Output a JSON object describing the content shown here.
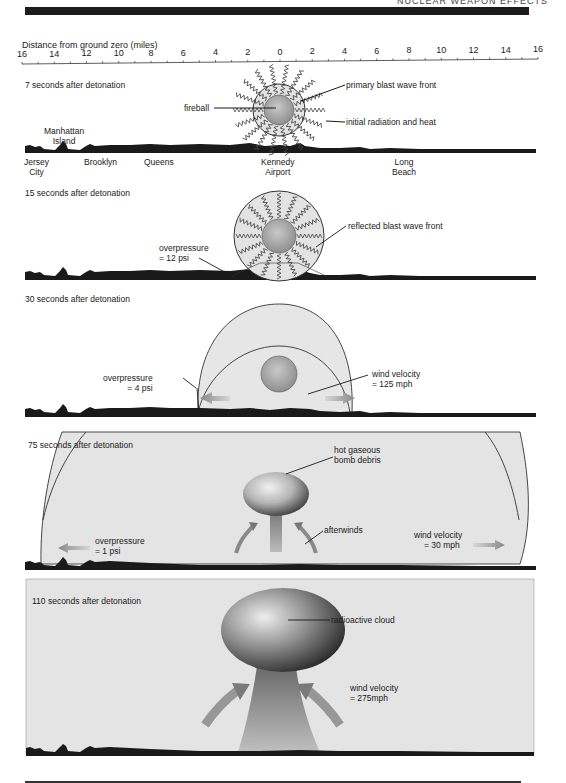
{
  "header": {
    "running_title": "NUCLEAR WEAPON EFFECTS"
  },
  "axis": {
    "title": "Distance from ground zero (miles)",
    "ticks": [
      "16",
      "14",
      "12",
      "10",
      "8",
      "6",
      "4",
      "2",
      "0",
      "2",
      "4",
      "6",
      "8",
      "10",
      "12",
      "14",
      "16"
    ]
  },
  "places": {
    "jersey_city_1": "Jersey",
    "jersey_city_2": "City",
    "manhattan_1": "Manhattan",
    "manhattan_2": "Island",
    "brooklyn": "Brooklyn",
    "queens": "Queens",
    "kennedy_1": "Kennedy",
    "kennedy_2": "Airport",
    "long_beach_1": "Long",
    "long_beach_2": "Beach"
  },
  "panels": [
    {
      "title": "7 seconds after detonation",
      "labels": {
        "fireball": "fireball",
        "primary": "primary blast wave front",
        "radiation": "initial radiation and heat"
      }
    },
    {
      "title": "15 seconds after detonation",
      "labels": {
        "overpressure_1": "overpressure",
        "overpressure_2": "= 12 psi",
        "reflected": "reflected blast wave front"
      }
    },
    {
      "title": "30 seconds after detonation",
      "labels": {
        "overpressure_1": "overpressure",
        "overpressure_2": "= 4 psi",
        "wind_1": "wind velocity",
        "wind_2": "= 125 mph"
      }
    },
    {
      "title": "75 seconds after detonation",
      "labels": {
        "debris_1": "hot gaseous",
        "debris_2": "bomb debris",
        "afterwinds": "afterwinds",
        "overpressure_1": "overpressure",
        "overpressure_2": "= 1 psi",
        "wind_1": "wind velocity",
        "wind_2": "= 30 mph"
      }
    },
    {
      "title": "110 seconds after detonation",
      "labels": {
        "cloud": "radioactive cloud",
        "wind_1": "wind velocity",
        "wind_2": "= 275mph"
      }
    }
  ],
  "colors": {
    "ink": "#1a1a1a",
    "panel_fill": "#e4e4e4",
    "dome_fill": "#e6e6e6",
    "arrow": "#8a8a8a"
  }
}
